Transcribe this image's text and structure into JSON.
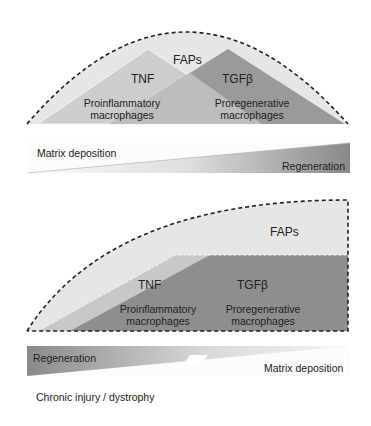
{
  "top_panel": {
    "faps": "FAPs",
    "tnf": "TNF",
    "tgfb": "TGFβ",
    "proinflammatory_1": "Proinflammatory",
    "proinflammatory_2": "macrophages",
    "proregenerative_1": "Proregenerative",
    "proregenerative_2": "macrophages"
  },
  "top_bar": {
    "left": "Matrix deposition",
    "right": "Regeneration"
  },
  "bottom_panel": {
    "faps": "FAPs",
    "tnf": "TNF",
    "tgfb": "TGFβ",
    "proinflammatory_1": "Proinflammatory",
    "proinflammatory_2": "macrophages",
    "proregenerative_1": "Proregenerative",
    "proregenerative_2": "macrophages"
  },
  "bottom_bar": {
    "left": "Regeneration",
    "right": "Matrix deposition"
  },
  "caption": "Chronic injury / dystrophy",
  "colors": {
    "faps_fill": "#e4e4e4",
    "tnf_fill": "#c8c8c8",
    "tgfb_fill": "#8e8e8e",
    "dashed_outline": "#222222"
  }
}
